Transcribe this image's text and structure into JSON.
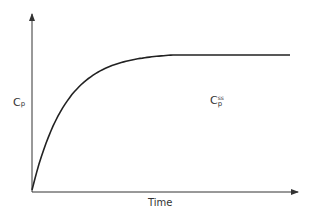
{
  "chart_data": {
    "type": "line",
    "title": "",
    "xlabel": "Time",
    "ylabel": "C_p",
    "annotations": [
      {
        "text": "C_p^ss",
        "meaning": "steady-state plasma concentration"
      }
    ],
    "series": [
      {
        "name": "Cp",
        "description": "Rises from 0 with decreasing slope (1 - e^-kt shape), reaching steady-state plateau around 53% of time axis and remaining constant",
        "x": [
          0,
          0.05,
          0.1,
          0.2,
          0.3,
          0.4,
          0.53,
          0.7,
          1.0
        ],
        "y": [
          0,
          0.38,
          0.58,
          0.78,
          0.88,
          0.95,
          1.0,
          1.0,
          1.0
        ]
      }
    ],
    "xlim": [
      0,
      1
    ],
    "ylim": [
      0,
      1.3
    ],
    "grid": false,
    "legend": false
  },
  "labels": {
    "y_main": "C",
    "y_sub": "p",
    "ss_main": "C",
    "ss_sub": "p",
    "ss_sup": "ss",
    "x_axis": "Time"
  },
  "colors": {
    "line": "#222222",
    "axis": "#333333"
  }
}
